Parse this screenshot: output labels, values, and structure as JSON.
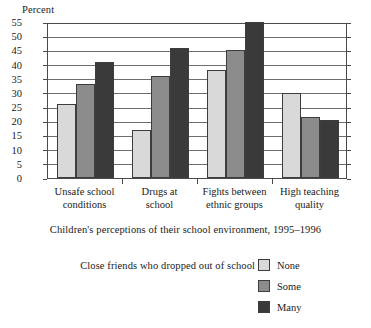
{
  "chart_data": {
    "type": "bar",
    "title": "",
    "caption": "Children's perceptions of their school environment, 1995–1996",
    "xlabel": "",
    "ylabel": "Percent",
    "ylim": [
      0,
      55
    ],
    "ytick_step": 5,
    "yticks": [
      0,
      5,
      10,
      15,
      20,
      25,
      30,
      35,
      40,
      45,
      50,
      55
    ],
    "grid": true,
    "legend_position": "bottom",
    "legend_title": "Close friends who dropped out of school",
    "categories": [
      "Unsafe school conditions",
      "Drugs at school",
      "Fights between ethnic groups",
      "High teaching quality"
    ],
    "category_lines": [
      [
        "Unsafe school",
        "conditions"
      ],
      [
        "Drugs at",
        "school"
      ],
      [
        "Fights between",
        "ethnic groups"
      ],
      [
        "High teaching",
        "quality"
      ]
    ],
    "series": [
      {
        "name": "None",
        "color": "#d9d9d9",
        "values": [
          26,
          17,
          38,
          30
        ]
      },
      {
        "name": "Some",
        "color": "#8c8c8c",
        "values": [
          33,
          36,
          45,
          21.5
        ]
      },
      {
        "name": "Many",
        "color": "#3a3a3a",
        "values": [
          41,
          46,
          55,
          20.5
        ]
      }
    ]
  }
}
